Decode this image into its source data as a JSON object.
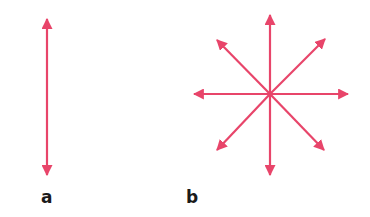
{
  "colors": {
    "arrow": "#e8456a",
    "label": "#1a1a1a"
  },
  "panels": [
    {
      "label": "a",
      "description": "single double-headed vertical arrow"
    },
    {
      "label": "b",
      "description": "eight arrows radiating from a common center"
    }
  ]
}
